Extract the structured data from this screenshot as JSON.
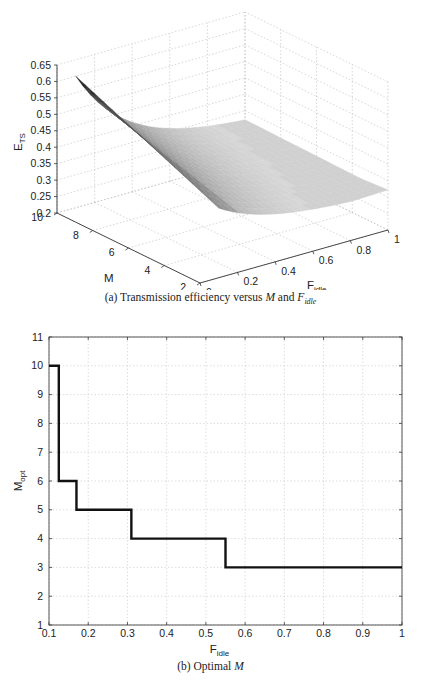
{
  "chart_data": [
    {
      "id": "a",
      "type": "surface3d",
      "title": "",
      "caption": {
        "prefix": "(a) Transmission efficiency versus ",
        "var1": "M",
        "mid": " and ",
        "var2": "F",
        "var2_sub": "idle"
      },
      "zlabel": "E",
      "zlabel_sub": "TS",
      "ylabel": "M",
      "xlabel": "F",
      "xlabel_sub": "idle",
      "z_ticks": [
        "0.65",
        "0.6",
        "0.55",
        "0.5",
        "0.45",
        "0.4",
        "0.35",
        "0.3",
        "0.25",
        "0.2"
      ],
      "zlim": [
        0.2,
        0.65
      ],
      "m_ticks": [
        "10",
        "8",
        "6",
        "4",
        "2"
      ],
      "mlim": [
        2,
        10
      ],
      "f_ticks": [
        "0",
        "0.2",
        "0.4",
        "0.6",
        "0.8",
        "1"
      ],
      "flim": [
        0,
        1
      ],
      "grid": true,
      "colormap": "gray",
      "surface_notes": "Efficiency peaks ~0.6 at M=10, F_idle~0.1, decreasing along a ridge toward ~0.31 at large F_idle; flat plateau ~0.27-0.31 for F_idle>0.55 across M",
      "sample_points": [
        {
          "M": 10,
          "F_idle": 0.1,
          "E_TS": 0.6
        },
        {
          "M": 6,
          "F_idle": 0.2,
          "E_TS": 0.45
        },
        {
          "M": 4,
          "F_idle": 0.4,
          "E_TS": 0.37
        },
        {
          "M": 3,
          "F_idle": 0.6,
          "E_TS": 0.31
        },
        {
          "M": 2,
          "F_idle": 1.0,
          "E_TS": 0.29
        }
      ]
    },
    {
      "id": "b",
      "type": "line",
      "step": true,
      "title": "",
      "caption": {
        "prefix": "(b) Optimal ",
        "var1": "M"
      },
      "xlabel": "F",
      "xlabel_sub": "idle",
      "ylabel": "M",
      "ylabel_sub": "opt",
      "xlim": [
        0.1,
        1
      ],
      "ylim": [
        1,
        11
      ],
      "x_ticks": [
        "0.1",
        "0.2",
        "0.3",
        "0.4",
        "0.5",
        "0.6",
        "0.7",
        "0.8",
        "0.9",
        "1"
      ],
      "y_ticks": [
        "1",
        "2",
        "3",
        "4",
        "5",
        "6",
        "7",
        "8",
        "9",
        "10",
        "11"
      ],
      "grid": true,
      "legend": null,
      "series": [
        {
          "name": "M_opt",
          "color": "#111111",
          "x": [
            0.1,
            0.125,
            0.125,
            0.17,
            0.17,
            0.31,
            0.31,
            0.55,
            0.55,
            1.0
          ],
          "y": [
            10,
            10,
            6,
            6,
            5,
            5,
            4,
            4,
            3,
            3
          ]
        }
      ]
    }
  ]
}
